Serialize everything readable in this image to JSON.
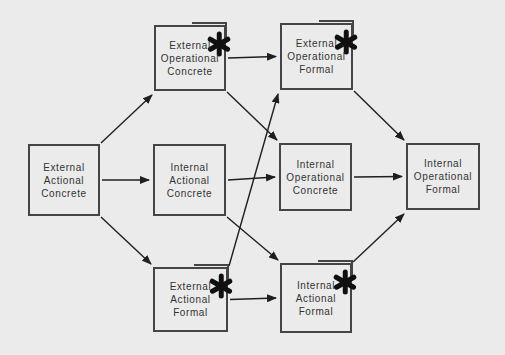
{
  "diagram": {
    "annotation_symbol": "asterisk",
    "colors": {
      "background": "#ebebeb",
      "box_border": "#454545",
      "text": "#333333",
      "arrow": "#1f1f1f",
      "asterisk": "#101010"
    },
    "boxes": [
      {
        "id": "eac",
        "label": "External Actional Concrete",
        "lines": [
          "External",
          "Actional",
          "Concrete"
        ],
        "starred": false
      },
      {
        "id": "eoc",
        "label": "External Operational Concrete",
        "lines": [
          "External",
          "Operational",
          "Concrete"
        ],
        "starred": true
      },
      {
        "id": "eof",
        "label": "External Operational Formal",
        "lines": [
          "External",
          "Operational",
          "Formal"
        ],
        "starred": true
      },
      {
        "id": "iac",
        "label": "Internal Actional Concrete",
        "lines": [
          "Internal",
          "Actional",
          "Concrete"
        ],
        "starred": false
      },
      {
        "id": "ioc",
        "label": "Internal Operational Concrete",
        "lines": [
          "Internal",
          "Operational",
          "Concrete"
        ],
        "starred": false
      },
      {
        "id": "iof",
        "label": "Internal Operational Formal",
        "lines": [
          "Internal",
          "Operational",
          "Formal"
        ],
        "starred": false
      },
      {
        "id": "eaf",
        "label": "External Actional Formal",
        "lines": [
          "External",
          "Actional",
          "Formal"
        ],
        "starred": true
      },
      {
        "id": "iaf",
        "label": "Internal Actional Formal",
        "lines": [
          "Internal",
          "Actional",
          "Formal"
        ],
        "starred": true
      }
    ],
    "edges": [
      {
        "from": "eac",
        "to": "eoc"
      },
      {
        "from": "eac",
        "to": "iac"
      },
      {
        "from": "eac",
        "to": "eaf"
      },
      {
        "from": "eoc",
        "to": "eof"
      },
      {
        "from": "eoc",
        "to": "ioc"
      },
      {
        "from": "iac",
        "to": "ioc"
      },
      {
        "from": "iac",
        "to": "iaf"
      },
      {
        "from": "eaf",
        "to": "eof"
      },
      {
        "from": "eaf",
        "to": "iaf"
      },
      {
        "from": "eof",
        "to": "iof"
      },
      {
        "from": "ioc",
        "to": "iof"
      },
      {
        "from": "iaf",
        "to": "iof"
      }
    ]
  }
}
